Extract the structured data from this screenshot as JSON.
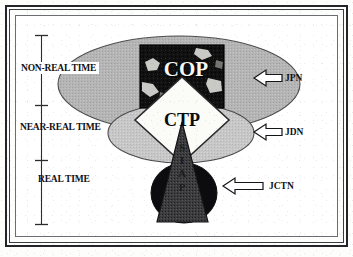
{
  "figure": {
    "frame": {
      "outer_border_color": "#22242a",
      "inner_border_color": "#6a6d74",
      "background_color": "#ffffff"
    }
  },
  "time_axis": {
    "name": "time-latency-scale",
    "tick_count": 4,
    "bands": [
      {
        "id": "non-real-time",
        "label": "NON-REAL TIME",
        "boxed": true,
        "top_tick_y": 35,
        "bottom_tick_y": 105
      },
      {
        "id": "near-real-time",
        "label": "NEAR-REAL TIME",
        "boxed": false,
        "top_tick_y": 105,
        "bottom_tick_y": 160
      },
      {
        "id": "real-time",
        "label": "REAL TIME",
        "boxed": false,
        "top_tick_y": 160,
        "bottom_tick_y": 225
      }
    ]
  },
  "network_callouts": [
    {
      "id": "jpn",
      "label": "JPN",
      "arrow": "left-arrow-icon",
      "targets": "non-real-time-ellipse"
    },
    {
      "id": "jdn",
      "label": "JDN",
      "arrow": "left-arrow-icon",
      "targets": "near-real-time-ellipse"
    },
    {
      "id": "jctn",
      "label": "JCTN",
      "arrow": "left-arrow-icon",
      "targets": "real-time-ellipse"
    }
  ],
  "shapes": {
    "outer_ellipse": {
      "name": "non-real-time-ellipse",
      "fill": "#b3b3b3",
      "stroke": "#4a4a4a",
      "cx": 179,
      "cy": 84,
      "rx": 121,
      "ry": 48
    },
    "middle_ellipse": {
      "name": "near-real-time-ellipse",
      "fill": "#c6c6c6",
      "stroke": "#4a4a4a",
      "cx": 181,
      "cy": 133,
      "rx": 73,
      "ry": 30
    },
    "inner_ellipse": {
      "name": "real-time-ellipse",
      "fill": "#0d0d0d",
      "stroke": "#0d0d0d",
      "cx": 184,
      "cy": 193,
      "rx": 33,
      "ry": 30
    },
    "cop_panel": {
      "name": "cop-map-panel",
      "fill": "#111111",
      "stroke": "#000000",
      "x": 140,
      "y": 45,
      "w": 84,
      "h": 63
    },
    "ctp_diamond": {
      "name": "ctp-diamond",
      "fill": "#fbfbf8",
      "stroke": "#2a2a2c",
      "cx": 182,
      "cy": 120,
      "rx": 47,
      "ry": 43
    },
    "siap_triangle": {
      "name": "siap-triangle",
      "fill": "#3a3a3c",
      "stroke": "#141416",
      "apex_x": 182,
      "apex_y": 122,
      "base_left_x": 157,
      "base_right_x": 208,
      "base_y": 222
    }
  },
  "captions": {
    "cop": "COP",
    "ctp": "CTP",
    "siap_letters": [
      "S",
      "I",
      "A",
      "P"
    ]
  },
  "colors": {
    "outer_gray": "#b3b3b3",
    "middle_gray": "#c6c6c6",
    "black": "#0d0d0d",
    "white": "#ffffff",
    "ink": "#101014"
  }
}
